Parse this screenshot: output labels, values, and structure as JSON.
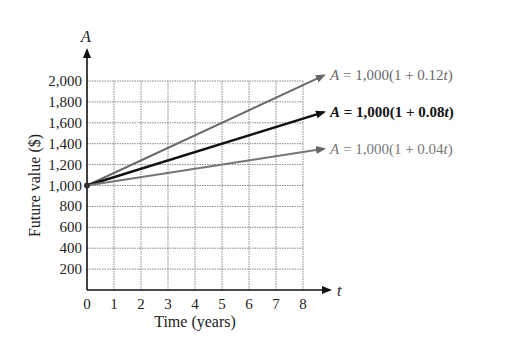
{
  "chart_data": {
    "type": "line",
    "title": "",
    "xlabel": "Time (years)",
    "ylabel": "Future value ($)",
    "x_axis_symbol": "t",
    "y_axis_symbol": "A",
    "xlim": [
      0,
      8
    ],
    "ylim": [
      0,
      2000
    ],
    "grid": true,
    "x_ticks": [
      "0",
      "1",
      "2",
      "3",
      "4",
      "5",
      "6",
      "7",
      "8"
    ],
    "y_ticks": [
      "200",
      "400",
      "600",
      "800",
      "1,000",
      "1,200",
      "1,400",
      "1,600",
      "1,800",
      "2,000"
    ],
    "series": [
      {
        "name": "A = 1,000(1 + 0.12t)",
        "rate": 0.12,
        "x": [
          0,
          8
        ],
        "values": [
          1000,
          1960
        ],
        "color": "#6a6a6a",
        "label_parts": {
          "var": "A",
          "eq": " = 1,000(1 + 0.12",
          "t": "t",
          "close": ")"
        }
      },
      {
        "name": "A = 1,000(1 + 0.08t)",
        "rate": 0.08,
        "x": [
          0,
          8
        ],
        "values": [
          1000,
          1640
        ],
        "color": "#111111",
        "label_parts": {
          "var": "A",
          "eq": " = 1,000(1 + 0.08",
          "t": "t",
          "close": ")"
        }
      },
      {
        "name": "A = 1,000(1 + 0.04t)",
        "rate": 0.04,
        "x": [
          0,
          8
        ],
        "values": [
          1000,
          1320
        ],
        "color": "#777777",
        "label_parts": {
          "var": "A",
          "eq": " = 1,000(1 + 0.04",
          "t": "t",
          "close": ")"
        }
      }
    ],
    "legend_position": "right, inline at line ends"
  }
}
